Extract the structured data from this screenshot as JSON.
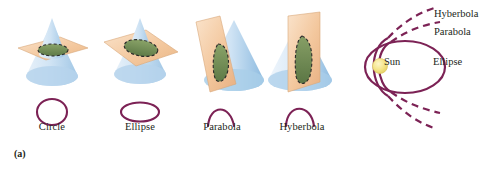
{
  "figure": {
    "accent_color": "#7c2255",
    "cone_fill_color": "#bcd8ef",
    "plane_fill_color": "#f2c9a0",
    "section_fill_color": "#6f8a53",
    "sun_color": "#f2e07a",
    "background": "#ffffff"
  },
  "panel_a": {
    "caption": "(a)",
    "cones": [
      {
        "label": "Circle",
        "plane_orientation": "horizontal",
        "section_shape": "circle",
        "icon": "cone-with-horizontal-plane-icon",
        "curve_icon": "circle-curve-icon"
      },
      {
        "label": "Ellipse",
        "plane_orientation": "tilted",
        "section_shape": "ellipse",
        "icon": "cone-with-tilted-plane-icon",
        "curve_icon": "ellipse-curve-icon"
      },
      {
        "label": "Parabola",
        "plane_orientation": "steeply-tilted",
        "section_shape": "parabola",
        "icon": "cone-with-steep-plane-icon",
        "curve_icon": "parabola-curve-icon"
      },
      {
        "label": "Hyberbola",
        "plane_orientation": "vertical",
        "section_shape": "hyperbola",
        "icon": "cone-with-vertical-plane-icon",
        "curve_icon": "hyperbola-curve-icon"
      }
    ]
  },
  "panel_b": {
    "caption": "(b)",
    "center_body": "Sun",
    "orbits": [
      {
        "label": "Hyberbola",
        "style": "open-dashed-outer"
      },
      {
        "label": "Parabola",
        "style": "open-dashed-inner"
      },
      {
        "label": "Ellipse",
        "style": "closed-solid"
      }
    ]
  }
}
